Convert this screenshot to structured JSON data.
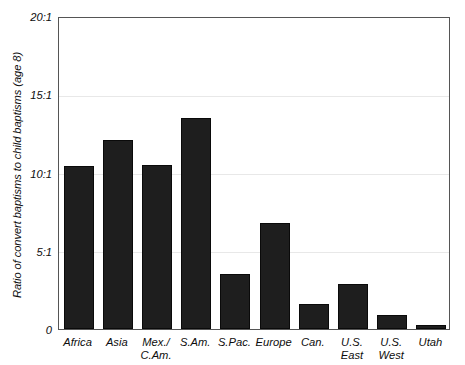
{
  "chart_data": {
    "type": "bar",
    "title": "",
    "subtitle": "",
    "xlabel": "",
    "ylabel": "Ratio of convert baptisms to child baptisms (age 8)",
    "categories": [
      "Africa",
      "Asia",
      "Mex./\nC.Am.",
      "S.Am.",
      "S.Pac.",
      "Europe",
      "Can.",
      "U.S.\nEast",
      "U.S.\nWest",
      "Utah"
    ],
    "values": [
      10.4,
      12.1,
      10.5,
      13.5,
      3.5,
      6.8,
      1.6,
      2.9,
      0.9,
      0.25
    ],
    "ylim": [
      0,
      20
    ],
    "ytick_values": [
      0,
      5,
      10,
      15,
      20
    ],
    "ytick_labels": [
      "0",
      "5:1",
      "10:1",
      "15:1",
      "20:1"
    ],
    "grid": "horizontal",
    "legend": "none",
    "bar_color": "#1e1e1e",
    "gridline_color": "#e8e8e8",
    "frame_color": "#555555",
    "background_color": "#ffffff"
  }
}
